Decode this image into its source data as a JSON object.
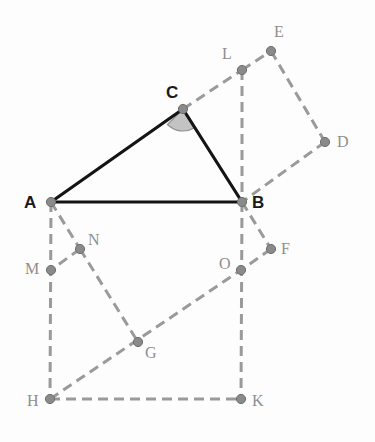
{
  "figure": {
    "background_color": "#fdfdfd",
    "canvas": {
      "width": 375,
      "height": 442
    }
  },
  "style": {
    "solid_stroke_color": "#141414",
    "dashed_stroke_color": "#9a9a9a",
    "vertex_fill_color": "#8a8a8a",
    "vertex_stroke_color": "#6e6e6e",
    "angle_arc_fill": "#c3c3c3",
    "angle_arc_stroke": "#8f8f8f",
    "primary_label_color": "#1a1a1a",
    "secondary_label_color": "#8e8e8e",
    "solid_width": 3.2,
    "dashed_width": 3.0,
    "dash_pattern": "10 6",
    "vertex_radius": 4.6
  },
  "points": [
    {
      "id": "A",
      "label": "A",
      "x": 51,
      "y": 202,
      "label_x": 24,
      "label_y": 194,
      "emphasis": "primary"
    },
    {
      "id": "B",
      "label": "B",
      "x": 242,
      "y": 202,
      "label_x": 252,
      "label_y": 194,
      "emphasis": "primary"
    },
    {
      "id": "C",
      "label": "C",
      "x": 183,
      "y": 109,
      "label_x": 166,
      "label_y": 84,
      "emphasis": "primary"
    },
    {
      "id": "L",
      "label": "L",
      "x": 242,
      "y": 70,
      "label_x": 222,
      "label_y": 46,
      "emphasis": "secondary"
    },
    {
      "id": "E",
      "label": "E",
      "x": 271,
      "y": 51,
      "label_x": 274,
      "label_y": 24,
      "emphasis": "secondary"
    },
    {
      "id": "D",
      "label": "D",
      "x": 325,
      "y": 142,
      "label_x": 337,
      "label_y": 134,
      "emphasis": "secondary"
    },
    {
      "id": "F",
      "label": "F",
      "x": 271,
      "y": 249,
      "label_x": 281,
      "label_y": 241,
      "emphasis": "secondary"
    },
    {
      "id": "O",
      "label": "O",
      "x": 241,
      "y": 270,
      "label_x": 219,
      "label_y": 256,
      "emphasis": "secondary"
    },
    {
      "id": "K",
      "label": "K",
      "x": 241,
      "y": 399,
      "label_x": 252,
      "label_y": 393,
      "emphasis": "secondary"
    },
    {
      "id": "H",
      "label": "H",
      "x": 50,
      "y": 399,
      "label_x": 27,
      "label_y": 393,
      "emphasis": "secondary"
    },
    {
      "id": "G",
      "label": "G",
      "x": 138,
      "y": 342,
      "label_x": 145,
      "label_y": 345,
      "emphasis": "secondary"
    },
    {
      "id": "M",
      "label": "M",
      "x": 51,
      "y": 270,
      "label_x": 25,
      "label_y": 261,
      "emphasis": "secondary"
    },
    {
      "id": "N",
      "label": "N",
      "x": 80,
      "y": 249,
      "label_x": 88,
      "label_y": 232,
      "emphasis": "secondary"
    }
  ],
  "segments_solid": [
    {
      "id": "AB",
      "from": "A",
      "to": "B",
      "x1": 51,
      "y1": 202,
      "x2": 242,
      "y2": 202
    },
    {
      "id": "AC",
      "from": "A",
      "to": "C",
      "x1": 51,
      "y1": 202,
      "x2": 183,
      "y2": 109
    },
    {
      "id": "CB",
      "from": "C",
      "to": "B",
      "x1": 183,
      "y1": 109,
      "x2": 242,
      "y2": 202
    }
  ],
  "segments_dashed": [
    {
      "id": "CL",
      "from": "C",
      "to": "L",
      "x1": 183,
      "y1": 109,
      "x2": 242,
      "y2": 70
    },
    {
      "id": "LE",
      "from": "L",
      "to": "E",
      "x1": 242,
      "y1": 70,
      "x2": 271,
      "y2": 51
    },
    {
      "id": "ED",
      "from": "E",
      "to": "D",
      "x1": 271,
      "y1": 51,
      "x2": 325,
      "y2": 142
    },
    {
      "id": "DB",
      "from": "D",
      "to": "B",
      "x1": 325,
      "y1": 142,
      "x2": 242,
      "y2": 202
    },
    {
      "id": "LB",
      "from": "L",
      "to": "B",
      "x1": 242,
      "y1": 70,
      "x2": 242,
      "y2": 202
    },
    {
      "id": "BF",
      "from": "B",
      "to": "F",
      "x1": 242,
      "y1": 202,
      "x2": 271,
      "y2": 249
    },
    {
      "id": "FO",
      "from": "F",
      "to": "O",
      "x1": 271,
      "y1": 249,
      "x2": 241,
      "y2": 270
    },
    {
      "id": "BK",
      "from": "B",
      "to": "K",
      "x1": 242,
      "y1": 202,
      "x2": 241,
      "y2": 399
    },
    {
      "id": "HK",
      "from": "H",
      "to": "K",
      "x1": 50,
      "y1": 399,
      "x2": 241,
      "y2": 399
    },
    {
      "id": "HO",
      "from": "H",
      "to": "O",
      "x1": 50,
      "y1": 399,
      "x2": 241,
      "y2": 270
    },
    {
      "id": "AH",
      "from": "A",
      "to": "H",
      "x1": 51,
      "y1": 202,
      "x2": 50,
      "y2": 399
    },
    {
      "id": "AN",
      "from": "A",
      "to": "N",
      "x1": 51,
      "y1": 202,
      "x2": 80,
      "y2": 249
    },
    {
      "id": "NM",
      "from": "N",
      "to": "M",
      "x1": 80,
      "y1": 249,
      "x2": 51,
      "y2": 270
    },
    {
      "id": "NG",
      "from": "N",
      "to": "G",
      "x1": 80,
      "y1": 249,
      "x2": 138,
      "y2": 342
    }
  ],
  "angle_marker": {
    "id": "angle-ACB",
    "at_point": "C",
    "vertex_x": 183,
    "vertex_y": 109,
    "radius": 22,
    "path": "M 183 109 L 167.4 124.5 A 22 22 0 0 0 194.1 128.0 Z"
  }
}
